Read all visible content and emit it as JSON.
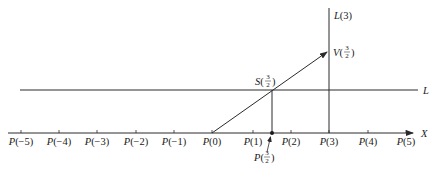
{
  "diagram": {
    "axis": {
      "label": "X",
      "ticks": [
        {
          "label_prefix": "P(",
          "value": "−5",
          "suffix": ")",
          "x": 21
        },
        {
          "label_prefix": "P(",
          "value": "−4",
          "suffix": ")",
          "x": 59
        },
        {
          "label_prefix": "P(",
          "value": "−3",
          "suffix": ")",
          "x": 97
        },
        {
          "label_prefix": "P(",
          "value": "−2",
          "suffix": ")",
          "x": 136
        },
        {
          "label_prefix": "P(",
          "value": "−1",
          "suffix": ")",
          "x": 174
        },
        {
          "label_prefix": "P(",
          "value": "0",
          "suffix": ")",
          "x": 212
        },
        {
          "label_prefix": "P(",
          "value": "1",
          "suffix": ")",
          "x": 253
        },
        {
          "label_prefix": "P(",
          "value": "2",
          "suffix": ")",
          "x": 291
        },
        {
          "label_prefix": "P(",
          "value": "3",
          "suffix": ")",
          "x": 329
        },
        {
          "label_prefix": "P(",
          "value": "4",
          "suffix": ")",
          "x": 368
        },
        {
          "label_prefix": "P(",
          "value": "5",
          "suffix": ")",
          "x": 406
        }
      ]
    },
    "line_L": {
      "label": "L"
    },
    "line_L3": {
      "label_letter": "L",
      "label_arg": "(3)"
    },
    "point_V": {
      "letter": "V",
      "num": "3",
      "den": "2"
    },
    "point_S": {
      "letter": "S",
      "num": "3",
      "den": "2"
    },
    "point_P_half": {
      "letter": "P",
      "num": "3",
      "den": "2"
    },
    "colors": {
      "stroke": "#2a2a2a",
      "text": "#1a1a1a",
      "background": "#ffffff"
    }
  }
}
